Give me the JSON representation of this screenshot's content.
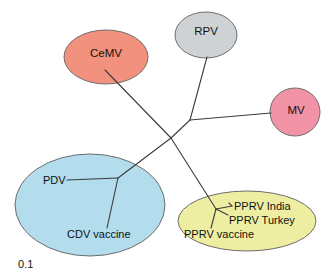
{
  "figure": {
    "type": "unrooted-phylogram"
  },
  "scale_bar": {
    "label": "0.1"
  },
  "groups": [
    {
      "id": "cemv",
      "label": "CeMV",
      "color": "#f2917d",
      "stroke": "#8a5b4f",
      "shape": "ellipse",
      "cx": 106,
      "cy": 57,
      "rx": 42,
      "ry": 27,
      "label_x": 106,
      "label_y": 54
    },
    {
      "id": "rpv",
      "label": "RPV",
      "color": "#cfd2d4",
      "stroke": "#7b8084",
      "shape": "ellipse",
      "cx": 206,
      "cy": 35,
      "rx": 31,
      "ry": 23,
      "label_x": 206,
      "label_y": 32
    },
    {
      "id": "mv",
      "label": "MV",
      "color": "#f192a6",
      "stroke": "#9c5b6c",
      "shape": "ellipse",
      "cx": 295,
      "cy": 112,
      "rx": 25,
      "ry": 24,
      "label_x": 296,
      "label_y": 111
    },
    {
      "id": "pdv-cdv",
      "label": "",
      "color": "#b3dced",
      "stroke": "#7d9fae",
      "shape": "ellipse",
      "cx": 90,
      "cy": 205,
      "rx": 75,
      "ry": 51,
      "label_x": 0,
      "label_y": 0
    },
    {
      "id": "pprv",
      "label": "",
      "color": "#eeeea2",
      "stroke": "#9a9a62",
      "shape": "ellipse",
      "cx": 247,
      "cy": 221,
      "rx": 69,
      "ry": 30,
      "label_x": 0,
      "label_y": 0
    }
  ],
  "taxa": [
    {
      "id": "pdv",
      "label": "PDV",
      "x": 43,
      "y": 181,
      "anchor": "start"
    },
    {
      "id": "cdv-vaccine",
      "label": "CDV vaccine",
      "x": 67,
      "y": 235,
      "anchor": "start"
    },
    {
      "id": "pprv-india",
      "label": "PPRV India",
      "x": 234,
      "y": 207,
      "anchor": "start"
    },
    {
      "id": "pprv-turkey",
      "label": "PPRV Turkey",
      "x": 229,
      "y": 221,
      "anchor": "start"
    },
    {
      "id": "pprv-vaccine",
      "label": "PPRV vaccine",
      "x": 184,
      "y": 235,
      "anchor": "start"
    }
  ],
  "branches": [
    {
      "id": "branch-center-to-cemv",
      "points": "171,138 105,70"
    },
    {
      "id": "branch-center-to-rpvmv-node",
      "points": "171,138 190,120"
    },
    {
      "id": "branch-rpvmv-node-to-rpv",
      "points": "190,120 207,57"
    },
    {
      "id": "branch-rpvmv-node-to-mv",
      "points": "190,120 271,113"
    },
    {
      "id": "branch-center-to-pdv-node",
      "points": "171,138 118,178"
    },
    {
      "id": "branch-pdv-node-to-pdv",
      "points": "118,178 67,180"
    },
    {
      "id": "branch-pdv-node-to-cdv",
      "points": "118,178 107,228"
    },
    {
      "id": "branch-center-to-pprv-node",
      "points": "171,138 216,209"
    },
    {
      "id": "branch-pprv-node-to-india",
      "points": "216,209 232,206"
    },
    {
      "id": "branch-pprv-india-tick",
      "points": "232,206 229,203"
    },
    {
      "id": "branch-pprv-node-to-turkey",
      "points": "216,209 228,215"
    },
    {
      "id": "branch-pprv-node-to-vaccine",
      "points": "216,209 211,228"
    }
  ],
  "scale": {
    "x": 18,
    "y": 268
  }
}
